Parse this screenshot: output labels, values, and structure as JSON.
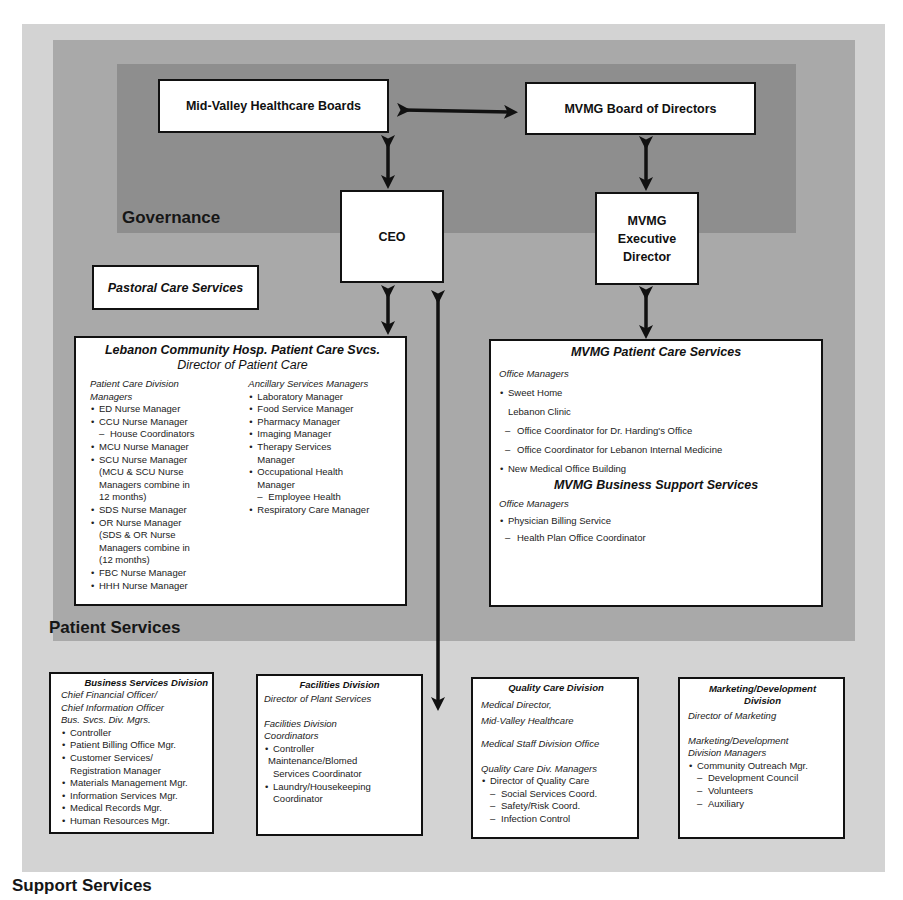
{
  "diagram": {
    "type": "organizational-chart",
    "layers": {
      "governance": {
        "label": "Governance",
        "color": "#8e8e8e"
      },
      "patient_services": {
        "label": "Patient Services",
        "color": "#a9a9a9"
      },
      "support_services": {
        "label": "Support Services",
        "color": "#d3d3d3"
      }
    },
    "governance": {
      "mid_valley_boards": "Mid-Valley Healthcare Boards",
      "mvmg_board": "MVMG Board of Directors",
      "ceo": "CEO",
      "mvmg_exec_director": [
        "MVMG",
        "Executive",
        "Director"
      ]
    },
    "pastoral_care": "Pastoral Care Services",
    "lebanon": {
      "title": "Lebanon Community Hosp. Patient Care Svcs.",
      "subtitle": "Director of Patient Care",
      "left": {
        "heading": [
          "Patient Care Division",
          "Managers"
        ],
        "items": [
          {
            "type": "b",
            "text": "ED Nurse Manager"
          },
          {
            "type": "b",
            "text": "CCU Nurse Manager"
          },
          {
            "type": "d",
            "text": "House Coordinators"
          },
          {
            "type": "b",
            "text": "MCU Nurse Manager"
          },
          {
            "type": "b",
            "text": "SCU Nurse Manager"
          },
          {
            "type": "c",
            "text": "(MCU & SCU Nurse"
          },
          {
            "type": "c",
            "text": "Managers combine in"
          },
          {
            "type": "c",
            "text": "12 months)"
          },
          {
            "type": "b",
            "text": "SDS Nurse Manager"
          },
          {
            "type": "b",
            "text": "OR Nurse Manager"
          },
          {
            "type": "c",
            "text": "(SDS & OR Nurse"
          },
          {
            "type": "c",
            "text": "Managers combine in"
          },
          {
            "type": "c",
            "text": "(12 months)"
          },
          {
            "type": "b",
            "text": "FBC Nurse Manager"
          },
          {
            "type": "b",
            "text": "HHH Nurse Manager"
          }
        ]
      },
      "right": {
        "heading": "Ancillary Services Managers",
        "items": [
          {
            "type": "b",
            "text": "Laboratory Manager"
          },
          {
            "type": "b",
            "text": "Food Service Manager"
          },
          {
            "type": "b",
            "text": "Pharmacy Manager"
          },
          {
            "type": "b",
            "text": "Imaging Manager"
          },
          {
            "type": "b",
            "text": "Therapy Services"
          },
          {
            "type": "c",
            "text": "Manager"
          },
          {
            "type": "b",
            "text": "Occupational Health"
          },
          {
            "type": "c",
            "text": "Manager"
          },
          {
            "type": "d",
            "text": "Employee Health"
          },
          {
            "type": "b",
            "text": "Respiratory Care Manager"
          }
        ]
      }
    },
    "mvmg_patient_care": {
      "title": "MVMG Patient Care Services",
      "heading": "Office Managers",
      "items": [
        {
          "type": "b",
          "text": "Sweet Home"
        },
        {
          "type": "c",
          "text": "Lebanon Clinic"
        },
        {
          "type": "d",
          "text": "Office Coordinator for Dr. Harding's Office"
        },
        {
          "type": "d",
          "text": "Office Coordinator for Lebanon Internal Medicine"
        },
        {
          "type": "b",
          "text": "New Medical Office Building"
        }
      ]
    },
    "mvmg_business_support": {
      "title": "MVMG Business Support Services",
      "heading": "Office Managers",
      "items": [
        {
          "type": "b",
          "text": "Physician Billing Service"
        },
        {
          "type": "d",
          "text": "Health Plan Office Coordinator"
        }
      ]
    },
    "business_services": {
      "title": "Business Services Division",
      "headings": [
        "Chief Financial Officer/",
        "Chief Information Officer",
        "Bus. Svcs. Div. Mgrs."
      ],
      "items": [
        {
          "type": "b",
          "text": "Controller"
        },
        {
          "type": "b",
          "text": "Patient Billing Office Mgr."
        },
        {
          "type": "b",
          "text": "Customer Services/"
        },
        {
          "type": "c",
          "text": "Registration Manager"
        },
        {
          "type": "b",
          "text": "Materials Management Mgr."
        },
        {
          "type": "b",
          "text": "Information Services Mgr."
        },
        {
          "type": "b",
          "text": "Medical Records Mgr."
        },
        {
          "type": "b",
          "text": "Human Resources Mgr."
        }
      ]
    },
    "facilities": {
      "title": "Facilities Division",
      "director": "Director of Plant Services",
      "headings": [
        "Facilities Division",
        "Coordinators"
      ],
      "items": [
        {
          "type": "b",
          "text": "Controller"
        },
        {
          "type": "c",
          "text": "Maintenance/Blomed"
        },
        {
          "type": "c",
          "text": "Services Coordinator"
        },
        {
          "type": "b",
          "text": "Laundry/Housekeeping"
        },
        {
          "type": "c",
          "text": "Coordinator"
        }
      ]
    },
    "quality_care": {
      "title": "Quality Care Division",
      "director": [
        "Medical Director,",
        "Mid-Valley Healthcare"
      ],
      "office": "Medical Staff Division Office",
      "heading": "Quality Care Div. Managers",
      "items": [
        {
          "type": "b",
          "text": "Director of Quality Care"
        },
        {
          "type": "d",
          "text": "Social Services Coord."
        },
        {
          "type": "d",
          "text": "Safety/Risk Coord."
        },
        {
          "type": "d",
          "text": "Infection Control"
        }
      ]
    },
    "marketing": {
      "title": [
        "Marketing/Development",
        "Division"
      ],
      "director": "Director of Marketing",
      "headings": [
        "Marketing/Development",
        "Division Managers"
      ],
      "items": [
        {
          "type": "b",
          "text": "Community Outreach Mgr."
        },
        {
          "type": "d",
          "text": "Development Council"
        },
        {
          "type": "d",
          "text": "Volunteers"
        },
        {
          "type": "d",
          "text": "Auxiliary"
        }
      ]
    }
  }
}
